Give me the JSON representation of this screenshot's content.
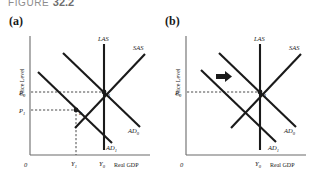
{
  "figure": {
    "caption_prefix": "FIGURE",
    "caption_number": "32.2"
  },
  "panels": [
    {
      "key": "a",
      "label": "(a)",
      "y_axis_title": "Price Level",
      "x_axis_title": "Real GDP",
      "origin_label": "0",
      "curves": {
        "las": "LAS",
        "sas": "SAS",
        "ad0": "AD",
        "ad0_sub": "0",
        "ad1": "AD",
        "ad1_sub": "1"
      },
      "price_ticks": [
        {
          "base": "P",
          "sub": "0"
        },
        {
          "base": "P",
          "sub": "1"
        }
      ],
      "output_ticks": [
        {
          "base": "Y",
          "sub": "1"
        },
        {
          "base": "Y",
          "sub": "0"
        }
      ],
      "points": [
        "a",
        "b"
      ],
      "has_arrow": false
    },
    {
      "key": "b",
      "label": "(b)",
      "y_axis_title": "Price Level",
      "x_axis_title": "Real GDP",
      "origin_label": "0",
      "curves": {
        "las": "LAS",
        "sas": "SAS",
        "ad0": "AD",
        "ad0_sub": "0",
        "ad1": "AD",
        "ad1_sub": "1"
      },
      "price_ticks": [
        {
          "base": "P",
          "sub": "0"
        }
      ],
      "output_ticks": [
        {
          "base": "Y",
          "sub": "0"
        }
      ],
      "points": [
        "a"
      ],
      "has_arrow": true,
      "arrow_name": "leftward-shift-arrow"
    }
  ],
  "style": {
    "curve_color": "#1a1a1a",
    "axis_color": "#6b6b6b",
    "dash_color": "#4a4a4a",
    "caption_color": "#8d8d8d"
  }
}
